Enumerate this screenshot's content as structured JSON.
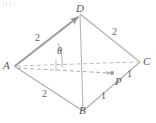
{
  "figure": {
    "colors": {
      "solid_edge": "#a9a9ab",
      "vector_edge": "#9b9b9d",
      "dashed": "#b3b3b5",
      "label_text": "#55585c",
      "background": "#ffffff"
    },
    "vertices": [
      {
        "id": "A",
        "label": "A",
        "x": 14,
        "y": 66
      },
      {
        "id": "B",
        "label": "B",
        "x": 83,
        "y": 111
      },
      {
        "id": "C",
        "label": "C",
        "x": 140,
        "y": 62
      },
      {
        "id": "D",
        "label": "D",
        "x": 80,
        "y": 12
      },
      {
        "id": "P",
        "label": "P",
        "x": 117,
        "y": 79
      }
    ],
    "edge_labels": [
      {
        "id": "AD-len",
        "text": "2",
        "x": 38,
        "y": 38,
        "edge": "A-D"
      },
      {
        "id": "DC-len",
        "text": "2",
        "x": 114,
        "y": 32,
        "edge": "D-C"
      },
      {
        "id": "AB-len",
        "text": "2",
        "x": 44,
        "y": 94,
        "edge": "A-B"
      },
      {
        "id": "PC-len",
        "text": "1",
        "x": 128,
        "y": 74,
        "edge": "P-C"
      },
      {
        "id": "BP-len",
        "text": "1",
        "x": 102,
        "y": 96,
        "edge": "B-P"
      }
    ],
    "angle": {
      "id": "theta",
      "symbol": "θ",
      "x": 58,
      "y": 50,
      "at_vertex": "A",
      "between": [
        "A-D",
        "A-P"
      ]
    },
    "point_marker": {
      "id": "P-dot",
      "x": 112,
      "y": 73
    },
    "vectors": [
      {
        "id": "AD",
        "from": "A",
        "to": "D",
        "style": "solid-arrow"
      },
      {
        "id": "AP",
        "from": "A",
        "to": "P",
        "style": "dashed-arrow"
      },
      {
        "id": "AC",
        "from": "A",
        "to": "C",
        "style": "dashed"
      }
    ],
    "solid_edges": [
      {
        "id": "A-D",
        "from": "A",
        "to": "D"
      },
      {
        "id": "D-C",
        "from": "D",
        "to": "C"
      },
      {
        "id": "A-B",
        "from": "A",
        "to": "B"
      },
      {
        "id": "B-C",
        "from": "B",
        "to": "C"
      },
      {
        "id": "D-B",
        "from": "D",
        "to": "B"
      }
    ]
  }
}
